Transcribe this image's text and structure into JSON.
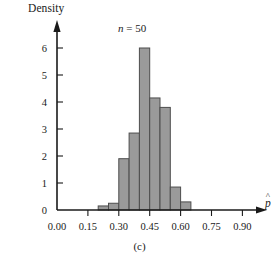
{
  "figure": {
    "caption": "(c)",
    "title_n_symbol": "n",
    "title_equals": "=",
    "title_value": "50",
    "title_full": "n = 50",
    "y_axis_label": "Density",
    "x_axis_label_base": "p",
    "x_axis_label_accent": "^",
    "x_axis_label_full": "p̂"
  },
  "chart_data": {
    "type": "bar",
    "xlabel": "p̂",
    "ylabel": "Density",
    "grid": false,
    "legend": null,
    "xlim": [
      0.0,
      1.0
    ],
    "ylim": [
      0,
      6.4
    ],
    "bin_width": 0.05,
    "x_ticks": [
      0.0,
      0.15,
      0.3,
      0.45,
      0.6,
      0.75,
      0.9
    ],
    "x_tick_labels": [
      "0.00",
      "0.15",
      "0.30",
      "0.45",
      "0.60",
      "0.75",
      "0.90"
    ],
    "y_ticks": [
      0,
      1,
      2,
      3,
      4,
      5,
      6
    ],
    "y_tick_labels": [
      "0",
      "1",
      "2",
      "3",
      "4",
      "5",
      "6"
    ],
    "bin_edges": [
      0.2,
      0.25,
      0.3,
      0.35,
      0.4,
      0.45,
      0.5,
      0.55,
      0.6,
      0.65
    ],
    "categories": [
      "0.20-0.25",
      "0.25-0.30",
      "0.30-0.35",
      "0.35-0.40",
      "0.40-0.45",
      "0.45-0.50",
      "0.50-0.55",
      "0.55-0.60",
      "0.60-0.65"
    ],
    "values": [
      0.15,
      0.25,
      1.9,
      2.85,
      6.0,
      4.15,
      3.8,
      0.85,
      0.3
    ],
    "bar_fill_color": "#9a9a9a",
    "bar_edge_color": "#4d4d4d",
    "axis_color": "#1a1a1a"
  }
}
